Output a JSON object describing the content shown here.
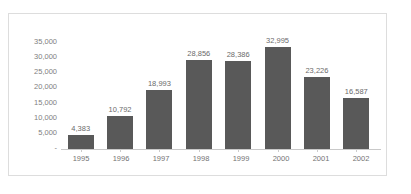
{
  "page": {
    "ghost_text_top": "",
    "ghost_text_bottom": ""
  },
  "chart": {
    "bar_color": "#595959",
    "label_color": "#6b6b6b",
    "axis_color": "#808080",
    "frame_color": "#dddddd",
    "baseline_color": "#c9c9c9",
    "y_ticks": [
      "35,000",
      "30,000",
      "25,000",
      "20,000",
      "15,000",
      "10,000",
      "5,000",
      "-"
    ],
    "x_ticks": [
      "1995",
      "1996",
      "1997",
      "1998",
      "1999",
      "2000",
      "2001",
      "2002"
    ],
    "bar_labels": [
      "4,383",
      "10,792",
      "18,993",
      "28,856",
      "28,386",
      "32,995",
      "23,226",
      "16,587"
    ]
  },
  "chart_data": {
    "type": "bar",
    "title": "",
    "subtitle": "",
    "xlabel": "",
    "ylabel": "",
    "categories": [
      "1995",
      "1996",
      "1997",
      "1998",
      "1999",
      "2000",
      "2001",
      "2002"
    ],
    "values": [
      4383,
      10792,
      18993,
      28856,
      28386,
      32995,
      23226,
      16587
    ],
    "data_labels": [
      "4,383",
      "10,792",
      "18,993",
      "28,856",
      "28,386",
      "32,995",
      "23,226",
      "16,587"
    ],
    "ylim": [
      0,
      35000
    ],
    "ytick_values": [
      0,
      5000,
      10000,
      15000,
      20000,
      25000,
      30000,
      35000
    ],
    "ytick_labels": [
      "-",
      "5,000",
      "10,000",
      "15,000",
      "20,000",
      "25,000",
      "30,000",
      "35,000"
    ],
    "grid": false,
    "legend": false,
    "legend_position": "none",
    "series_color": "#595959",
    "annotations": []
  }
}
